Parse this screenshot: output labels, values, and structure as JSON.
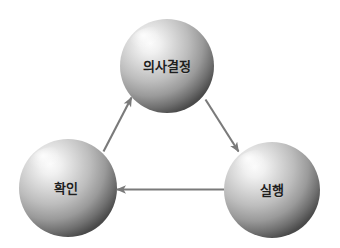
{
  "diagram": {
    "type": "cycle-diagram",
    "background_color": "#ffffff",
    "nodes": [
      {
        "id": "decision",
        "label": "의사결정",
        "position": "top",
        "cx": 167,
        "cy": 66,
        "r": 47,
        "shape": "sphere",
        "fill_light": "#f2f2f2",
        "fill_mid": "#b8b8b8",
        "fill_dark": "#4f4f4f",
        "label_color": "#1e1e1e"
      },
      {
        "id": "confirm",
        "label": "확인",
        "position": "bottom-left",
        "cx": 68,
        "cy": 188,
        "r": 49,
        "shape": "sphere",
        "fill_light": "#f2f2f2",
        "fill_mid": "#b8b8b8",
        "fill_dark": "#4f4f4f",
        "label_color": "#1e1e1e"
      },
      {
        "id": "execute",
        "label": "실행",
        "position": "bottom-right",
        "cx": 272,
        "cy": 190,
        "r": 48,
        "shape": "sphere",
        "fill_light": "#f2f2f2",
        "fill_mid": "#b8b8b8",
        "fill_dark": "#4f4f4f",
        "label_color": "#1e1e1e"
      }
    ],
    "arrows": [
      {
        "id": "confirm-to-decision",
        "from": "confirm",
        "to": "decision",
        "direction": "up-right",
        "color": "#7a7a7a"
      },
      {
        "id": "decision-to-execute",
        "from": "decision",
        "to": "execute",
        "direction": "down-right",
        "color": "#7a7a7a"
      },
      {
        "id": "execute-to-confirm",
        "from": "execute",
        "to": "confirm",
        "direction": "left",
        "color": "#7a7a7a"
      }
    ]
  }
}
